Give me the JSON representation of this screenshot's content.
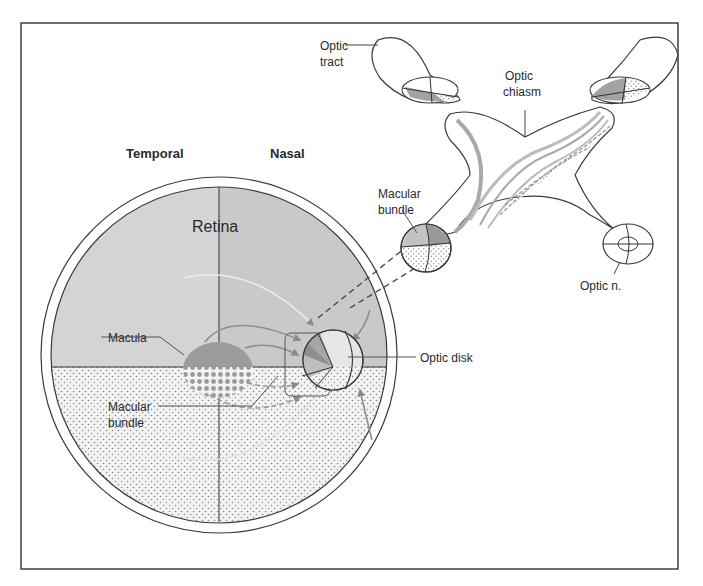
{
  "figure": {
    "orientation_labels": {
      "temporal": "Temporal",
      "nasal": "Nasal"
    },
    "labels": {
      "retina": "Retina",
      "macula": "Macula",
      "macular_bundle_retina": [
        "Macular",
        "bundle"
      ],
      "optic_disk": "Optic disk",
      "optic_tract": [
        "Optic",
        "tract"
      ],
      "optic_chiasm": [
        "Optic",
        "chiasm"
      ],
      "macular_bundle_nerve": [
        "Macular",
        "bundle"
      ],
      "optic_nerve": "Optic n."
    },
    "colors": {
      "background": "#ffffff",
      "frame": "#333333",
      "retina_upper": "#d3d3d3",
      "retina_upper_nasal": "#c8c8c8",
      "retina_lower": "#efefef",
      "macula": "#9a9a9a",
      "fiber_gray": "#a8a8a8",
      "outline": "#3a3a3a"
    }
  }
}
